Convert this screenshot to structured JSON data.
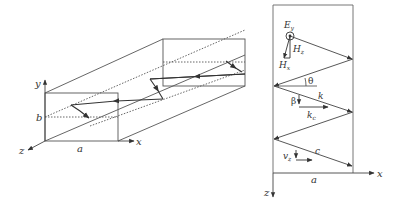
{
  "figure_left": {
    "title": "Rectangular waveguide (3D view)",
    "labels": {
      "y_axis": "y",
      "x_axis": "x",
      "z_axis": "z",
      "width": "a",
      "height": "b"
    }
  },
  "figure_right": {
    "title": "Plane-wave zigzag in waveguide (top view)",
    "labels": {
      "E_main": "E",
      "E_sub": "y",
      "Hz_main": "H",
      "Hz_sub": "z",
      "Hx_main": "H",
      "Hx_sub": "x",
      "theta": "θ",
      "k": "k",
      "beta": "β",
      "kc_main": "k",
      "kc_sub": "c",
      "c": "c",
      "vz_main": "v",
      "vz_sub": "z",
      "width": "a",
      "x_axis": "x",
      "z_axis": "z"
    }
  },
  "colors": {
    "line": "#555555",
    "arrow": "#333333"
  }
}
